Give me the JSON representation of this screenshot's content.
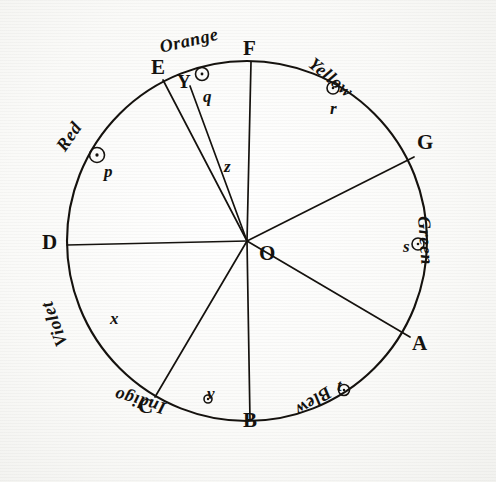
{
  "figure": {
    "center_label": "O",
    "ink_color": "#15120e",
    "paper_color": "#fbfbfa",
    "geometry": {
      "center_x": 247,
      "center_y": 241,
      "radius": 180
    }
  },
  "rim_letters": [
    {
      "id": "A",
      "label": "A",
      "x": 412,
      "y": 333,
      "angle_deg": 325
    },
    {
      "id": "B",
      "label": "B",
      "x": 243,
      "y": 410,
      "angle_deg": 270
    },
    {
      "id": "C",
      "label": "C",
      "x": 138,
      "y": 396,
      "angle_deg": 237
    },
    {
      "id": "D",
      "label": "D",
      "x": 42,
      "y": 232,
      "angle_deg": 180
    },
    {
      "id": "E",
      "label": "E",
      "x": 151,
      "y": 57,
      "angle_deg": 118
    },
    {
      "id": "F",
      "label": "F",
      "x": 243,
      "y": 38,
      "angle_deg": 90
    },
    {
      "id": "G",
      "label": "G",
      "x": 417,
      "y": 132,
      "angle_deg": 27
    },
    {
      "id": "Y",
      "label": "Y",
      "x": 177,
      "y": 72,
      "angle_deg": 108
    }
  ],
  "color_names": [
    {
      "id": "red",
      "label": "Red",
      "x": 60,
      "y": 140,
      "rotate_deg": -55,
      "swatch": "#c02a1c"
    },
    {
      "id": "orange",
      "label": "Orange",
      "x": 160,
      "y": 38,
      "rotate_deg": -13,
      "swatch": "#e07a1b"
    },
    {
      "id": "yellow",
      "label": "Yellow",
      "x": 311,
      "y": 52,
      "rotate_deg": 39,
      "swatch": "#e8c319"
    },
    {
      "id": "green",
      "label": "Green",
      "x": 424,
      "y": 207,
      "rotate_deg": 86,
      "swatch": "#2d7d32"
    },
    {
      "id": "blew",
      "label": "Blew",
      "x": 330,
      "y": 382,
      "rotate_deg": 147,
      "swatch": "#1f4fa3"
    },
    {
      "id": "indigo",
      "label": "Indigo",
      "x": 165,
      "y": 400,
      "rotate_deg": 196,
      "swatch": "#3b2f86"
    },
    {
      "id": "violet",
      "label": "Violet",
      "x": 62,
      "y": 337,
      "rotate_deg": 250,
      "swatch": "#7a3b96"
    }
  ],
  "point_labels": [
    {
      "id": "p",
      "label": "p",
      "x": 104,
      "y": 163,
      "has_circle": true,
      "circle_x": 97,
      "circle_y": 155,
      "circle_r": 7.5
    },
    {
      "id": "q",
      "label": "q",
      "x": 203,
      "y": 88,
      "has_circle": true,
      "circle_x": 202,
      "circle_y": 74,
      "circle_r": 6.5
    },
    {
      "id": "r",
      "label": "r",
      "x": 330,
      "y": 100,
      "has_circle": true,
      "circle_x": 333,
      "circle_y": 88,
      "circle_r": 6.0
    },
    {
      "id": "s",
      "label": "s",
      "x": 403,
      "y": 238,
      "has_circle": true,
      "circle_x": 418,
      "circle_y": 244,
      "circle_r": 6.0
    },
    {
      "id": "t",
      "label": "t",
      "x": 337,
      "y": 377,
      "has_circle": true,
      "circle_x": 344,
      "circle_y": 390,
      "circle_r": 5.5
    },
    {
      "id": "v",
      "label": "v",
      "x": 207,
      "y": 385,
      "has_circle": true,
      "circle_x": 208,
      "circle_y": 399,
      "circle_r": 4.0
    },
    {
      "id": "x",
      "label": "x",
      "x": 110,
      "y": 310,
      "has_circle": false,
      "circle_x": 0,
      "circle_y": 0,
      "circle_r": 0
    },
    {
      "id": "z",
      "label": "z",
      "x": 224,
      "y": 158,
      "has_circle": false,
      "circle_x": 0,
      "circle_y": 0,
      "circle_r": 0
    }
  ],
  "radii": [
    {
      "id": "radius-OA",
      "to": "A",
      "x2": 410,
      "y2": 337
    },
    {
      "id": "radius-OB",
      "to": "B",
      "x2": 250,
      "y2": 420
    },
    {
      "id": "radius-OC",
      "to": "C",
      "x2": 155,
      "y2": 397
    },
    {
      "id": "radius-OD",
      "to": "D",
      "x2": 67,
      "y2": 245
    },
    {
      "id": "radius-OE",
      "to": "E",
      "x2": 163,
      "y2": 80
    },
    {
      "id": "radius-OF",
      "to": "F",
      "x2": 251,
      "y2": 62
    },
    {
      "id": "radius-OG",
      "to": "G",
      "x2": 414,
      "y2": 157
    },
    {
      "id": "radius-OY",
      "to": "Y",
      "x2": 190,
      "y2": 86
    }
  ]
}
